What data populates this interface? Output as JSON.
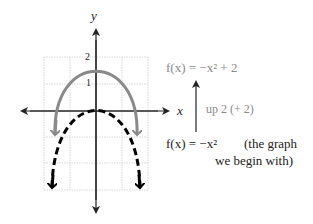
{
  "graph": {
    "y_axis_label": "y",
    "x_axis_label": "x",
    "tick_label_2": "2",
    "tick_label_1": "1"
  },
  "annotations": {
    "shifted_function": "f(x) = −x² + 2",
    "shift_note": "up 2 (+ 2)",
    "base_function": "f(x) = −x²",
    "base_note_line1": "(the graph",
    "base_note_line2": "we begin with)"
  },
  "colors": {
    "shifted_curve": "#8a8a8a",
    "base_curve": "#000000",
    "grid": "#cccccc",
    "axes": "#222222"
  }
}
